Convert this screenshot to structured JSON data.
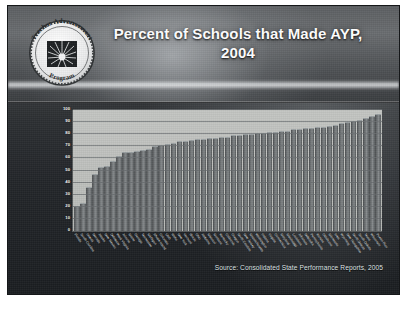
{
  "slide": {
    "title": "Percent of Schools that Made AYP, 2004",
    "title_line1": "Percent of Schools that Made AYP,",
    "title_line2": "2004",
    "source_note": "Source: Consolidated State Performance Reports, 2005",
    "background_color": "#2c2f32",
    "header_color": "#5c5f62",
    "title_color": "#ffffff",
    "plot_color": "#c3c5c2",
    "bar_color": "#6e7274"
  },
  "logo": {
    "name": "Teacher Advancement Program",
    "text_top": "Teacher Advancement",
    "text_bottom": "Program",
    "emblem": "sunburst-emblem"
  },
  "chart_data": {
    "type": "bar",
    "title": "Percent of Schools that Made AYP, 2004",
    "xlabel": "",
    "ylabel": "",
    "ylim": [
      0,
      100
    ],
    "yticks": [
      0,
      10,
      20,
      30,
      40,
      50,
      60,
      70,
      80,
      90,
      100
    ],
    "grid": true,
    "legend": "none",
    "sorted": "ascending",
    "categories": [
      "Florida",
      "South Carolina",
      "Hawaii",
      "Nevada",
      "Alaska",
      "New Mexico",
      "Delaware",
      "West Virginia",
      "Arizona",
      "Maine",
      "Georgia",
      "Tennessee",
      "Michigan",
      "Rhode Island",
      "Colorado",
      "Utah",
      "Idaho",
      "New York",
      "Vermont",
      "Illinois",
      "Ohio",
      "Alabama",
      "Missouri",
      "Montana",
      "Kentucky",
      "California",
      "Oregon",
      "North Carolina",
      "New Jersey",
      "Massachusetts",
      "Washington",
      "Indiana",
      "Virginia",
      "Connecticut",
      "Maryland",
      "Mississippi",
      "Louisiana",
      "Arkansas",
      "Nebraska",
      "Pennsylvania",
      "Kansas",
      "Oklahoma",
      "Minnesota",
      "Iowa",
      "Wyoming",
      "New Hampshire",
      "North Dakota",
      "South Dakota",
      "Texas",
      "Wisconsin",
      "Puerto Rico"
    ],
    "values": [
      21,
      23,
      36,
      47,
      53,
      54,
      58,
      62,
      65,
      65,
      66,
      67,
      68,
      70,
      71,
      72,
      73,
      74,
      74,
      75,
      76,
      76,
      77,
      77,
      78,
      78,
      79,
      79,
      80,
      80,
      81,
      81,
      82,
      82,
      83,
      83,
      84,
      84,
      85,
      85,
      86,
      86,
      87,
      88,
      89,
      90,
      91,
      92,
      93,
      95,
      97
    ]
  }
}
